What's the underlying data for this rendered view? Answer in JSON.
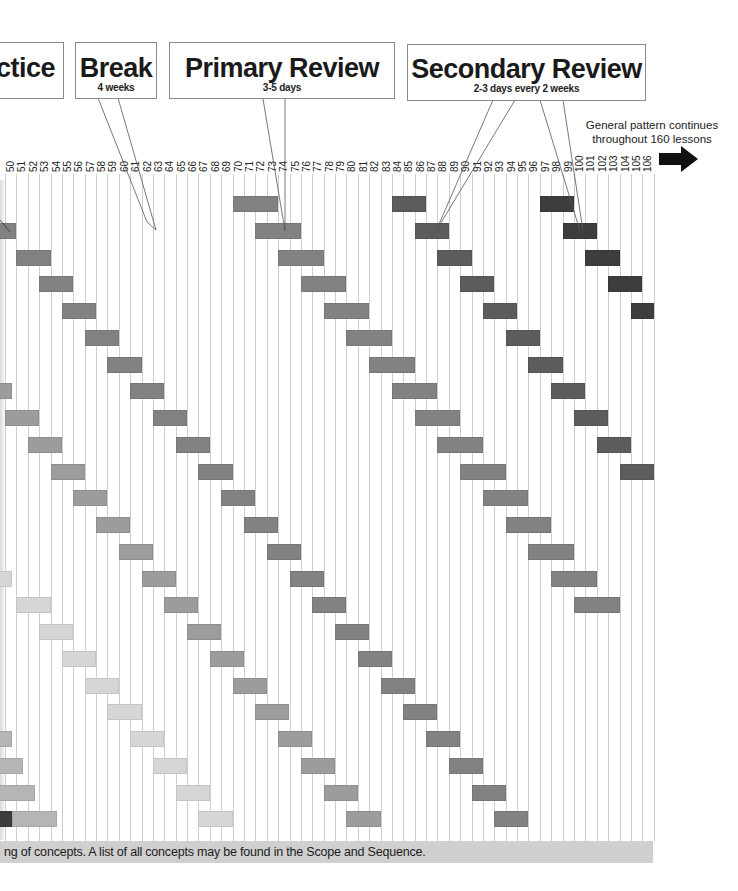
{
  "callouts": {
    "practice": {
      "title": "ctice"
    },
    "break": {
      "title": "Break",
      "subtitle": "4 weeks"
    },
    "primary": {
      "title": "Primary Review",
      "subtitle": "3-5 days"
    },
    "secondary": {
      "title": "Secondary Review",
      "subtitle": "2-3 days every 2 weeks"
    }
  },
  "note": {
    "line1": "General pattern continues",
    "line2": "throughout 160 lessons"
  },
  "footer": {
    "text": "ng of concepts. A list of all concepts may be found in the Scope and Sequence."
  },
  "grid": {
    "first_lesson": 50,
    "last_lesson": 106,
    "x0": 5,
    "col_width": 11.38,
    "row_y0": 196,
    "row_step": 26.75,
    "bar_height": 16
  },
  "colors": {
    "darkest": "#3d3d3d",
    "dark": "#5c5c5c",
    "mid": "#828282",
    "midlight": "#9c9c9c",
    "light": "#b5b5b5",
    "lightest": "#d6d6d6",
    "grid": "#cfcfcf",
    "footer_band": "#cfcfcf"
  },
  "chart_data": {
    "type": "table",
    "xlabel": "Lesson",
    "x_range": [
      50,
      106
    ],
    "annotation": "General pattern continues throughout 160 lessons",
    "legend": [
      "Practice",
      "Break (4 weeks)",
      "Primary Review (3-5 days)",
      "Secondary Review (2-3 days every 2 weeks)"
    ],
    "bars": [
      {
        "row": 1,
        "start": 49,
        "len": 2,
        "shade": "mid"
      },
      {
        "row": 2,
        "start": 51,
        "len": 3,
        "shade": "mid"
      },
      {
        "row": 3,
        "start": 53,
        "len": 3,
        "shade": "mid"
      },
      {
        "row": 4,
        "start": 55,
        "len": 3,
        "shade": "mid"
      },
      {
        "row": 5,
        "start": 57,
        "len": 3,
        "shade": "mid"
      },
      {
        "row": 6,
        "start": 59,
        "len": 3,
        "shade": "mid"
      },
      {
        "row": 7,
        "start": 61,
        "len": 3,
        "shade": "mid"
      },
      {
        "row": 8,
        "start": 63,
        "len": 3,
        "shade": "mid"
      },
      {
        "row": 9,
        "start": 65,
        "len": 3,
        "shade": "mid"
      },
      {
        "row": 10,
        "start": 67,
        "len": 3,
        "shade": "mid"
      },
      {
        "row": 11,
        "start": 69,
        "len": 3,
        "shade": "mid"
      },
      {
        "row": 12,
        "start": 71,
        "len": 3,
        "shade": "mid"
      },
      {
        "row": 13,
        "start": 73,
        "len": 3,
        "shade": "mid"
      },
      {
        "row": 14,
        "start": 75,
        "len": 3,
        "shade": "mid"
      },
      {
        "row": 15,
        "start": 77,
        "len": 3,
        "shade": "mid"
      },
      {
        "row": 16,
        "start": 79,
        "len": 3,
        "shade": "mid"
      },
      {
        "row": 17,
        "start": 81,
        "len": 3,
        "shade": "mid"
      },
      {
        "row": 18,
        "start": 83,
        "len": 3,
        "shade": "mid"
      },
      {
        "row": 19,
        "start": 85,
        "len": 3,
        "shade": "mid"
      },
      {
        "row": 20,
        "start": 87,
        "len": 3,
        "shade": "mid"
      },
      {
        "row": 21,
        "start": 89,
        "len": 3,
        "shade": "mid"
      },
      {
        "row": 22,
        "start": 91,
        "len": 3,
        "shade": "mid"
      },
      {
        "row": 23,
        "start": 93,
        "len": 3,
        "shade": "mid"
      },
      {
        "row": 0,
        "start": 70,
        "len": 4,
        "shade": "mid"
      },
      {
        "row": 1,
        "start": 72,
        "len": 4,
        "shade": "mid"
      },
      {
        "row": 2,
        "start": 74,
        "len": 4,
        "shade": "mid"
      },
      {
        "row": 3,
        "start": 76,
        "len": 4,
        "shade": "mid"
      },
      {
        "row": 4,
        "start": 78,
        "len": 4,
        "shade": "mid"
      },
      {
        "row": 5,
        "start": 80,
        "len": 4,
        "shade": "mid"
      },
      {
        "row": 6,
        "start": 82,
        "len": 4,
        "shade": "mid"
      },
      {
        "row": 7,
        "start": 84,
        "len": 4,
        "shade": "mid"
      },
      {
        "row": 8,
        "start": 86,
        "len": 4,
        "shade": "mid"
      },
      {
        "row": 9,
        "start": 88,
        "len": 4,
        "shade": "mid"
      },
      {
        "row": 10,
        "start": 90,
        "len": 4,
        "shade": "mid"
      },
      {
        "row": 11,
        "start": 92,
        "len": 4,
        "shade": "mid"
      },
      {
        "row": 12,
        "start": 94,
        "len": 4,
        "shade": "mid"
      },
      {
        "row": 13,
        "start": 96,
        "len": 4,
        "shade": "mid"
      },
      {
        "row": 14,
        "start": 98,
        "len": 4,
        "shade": "mid"
      },
      {
        "row": 15,
        "start": 100,
        "len": 4,
        "shade": "mid"
      },
      {
        "row": 0,
        "start": 84,
        "len": 3,
        "shade": "dark"
      },
      {
        "row": 1,
        "start": 86,
        "len": 3,
        "shade": "dark"
      },
      {
        "row": 2,
        "start": 88,
        "len": 3,
        "shade": "dark"
      },
      {
        "row": 3,
        "start": 90,
        "len": 3,
        "shade": "dark"
      },
      {
        "row": 4,
        "start": 92,
        "len": 3,
        "shade": "dark"
      },
      {
        "row": 5,
        "start": 94,
        "len": 3,
        "shade": "dark"
      },
      {
        "row": 6,
        "start": 96,
        "len": 3,
        "shade": "dark"
      },
      {
        "row": 7,
        "start": 98,
        "len": 3,
        "shade": "dark"
      },
      {
        "row": 8,
        "start": 100,
        "len": 3,
        "shade": "dark"
      },
      {
        "row": 9,
        "start": 102,
        "len": 3,
        "shade": "dark"
      },
      {
        "row": 10,
        "start": 104,
        "len": 3,
        "shade": "dark"
      },
      {
        "row": 0,
        "start": 97,
        "len": 3,
        "shade": "darkest"
      },
      {
        "row": 1,
        "start": 99,
        "len": 3,
        "shade": "darkest"
      },
      {
        "row": 2,
        "start": 101,
        "len": 3,
        "shade": "darkest"
      },
      {
        "row": 3,
        "start": 103,
        "len": 3,
        "shade": "darkest"
      },
      {
        "row": 4,
        "start": 105,
        "len": 2,
        "shade": "darkest"
      },
      {
        "row": 7,
        "start": 49,
        "len": 1.6,
        "shade": "midlight"
      },
      {
        "row": 8,
        "start": 50,
        "len": 3,
        "shade": "midlight"
      },
      {
        "row": 9,
        "start": 52,
        "len": 3,
        "shade": "midlight"
      },
      {
        "row": 10,
        "start": 54,
        "len": 3,
        "shade": "midlight"
      },
      {
        "row": 11,
        "start": 56,
        "len": 3,
        "shade": "midlight"
      },
      {
        "row": 12,
        "start": 58,
        "len": 3,
        "shade": "midlight"
      },
      {
        "row": 13,
        "start": 60,
        "len": 3,
        "shade": "midlight"
      },
      {
        "row": 14,
        "start": 62,
        "len": 3,
        "shade": "midlight"
      },
      {
        "row": 15,
        "start": 64,
        "len": 3,
        "shade": "midlight"
      },
      {
        "row": 16,
        "start": 66,
        "len": 3,
        "shade": "midlight"
      },
      {
        "row": 17,
        "start": 68,
        "len": 3,
        "shade": "midlight"
      },
      {
        "row": 18,
        "start": 70,
        "len": 3,
        "shade": "midlight"
      },
      {
        "row": 19,
        "start": 72,
        "len": 3,
        "shade": "midlight"
      },
      {
        "row": 20,
        "start": 74,
        "len": 3,
        "shade": "midlight"
      },
      {
        "row": 21,
        "start": 76,
        "len": 3,
        "shade": "midlight"
      },
      {
        "row": 22,
        "start": 78,
        "len": 3,
        "shade": "midlight"
      },
      {
        "row": 23,
        "start": 80,
        "len": 3,
        "shade": "midlight"
      },
      {
        "row": 14,
        "start": 49,
        "len": 1.6,
        "shade": "lightest"
      },
      {
        "row": 15,
        "start": 51,
        "len": 3,
        "shade": "lightest"
      },
      {
        "row": 16,
        "start": 53,
        "len": 3,
        "shade": "lightest"
      },
      {
        "row": 17,
        "start": 55,
        "len": 3,
        "shade": "lightest"
      },
      {
        "row": 18,
        "start": 57,
        "len": 3,
        "shade": "lightest"
      },
      {
        "row": 19,
        "start": 59,
        "len": 3,
        "shade": "lightest"
      },
      {
        "row": 20,
        "start": 61,
        "len": 3,
        "shade": "lightest"
      },
      {
        "row": 21,
        "start": 63,
        "len": 3,
        "shade": "lightest"
      },
      {
        "row": 22,
        "start": 65,
        "len": 3,
        "shade": "lightest"
      },
      {
        "row": 23,
        "start": 67,
        "len": 3,
        "shade": "lightest"
      },
      {
        "row": 20,
        "start": 49,
        "len": 1.6,
        "shade": "light"
      },
      {
        "row": 21,
        "start": 49,
        "len": 2.6,
        "shade": "light"
      },
      {
        "row": 22,
        "start": 49,
        "len": 3.6,
        "shade": "light"
      },
      {
        "row": 23,
        "start": 49,
        "len": 1.6,
        "shade": "darkest"
      },
      {
        "row": 23,
        "start": 50.6,
        "len": 4,
        "shade": "light"
      }
    ]
  }
}
